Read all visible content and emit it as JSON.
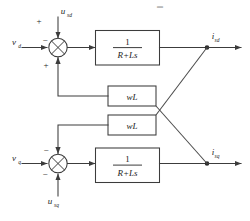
{
  "diagram": {
    "type": "block-diagram",
    "colors": {
      "line": "#3c3c3c",
      "text": "#1d1d1d",
      "background": "#ffffff"
    },
    "top_branch": {
      "input_label": "v",
      "input_sub": "d",
      "disturbance_label": "u",
      "disturbance_sub": "sd",
      "sign_top_left": "+",
      "sign_input": "−",
      "sign_bottom": "+",
      "plant_numerator": "1",
      "plant_denominator": "R+Ls",
      "output_label": "i",
      "output_sub": "sd"
    },
    "bottom_branch": {
      "input_label": "v",
      "input_sub": "q",
      "disturbance_label": "u",
      "disturbance_sub": "sq",
      "sign_top": "−",
      "sign_input": "−",
      "sign_bottom": "−",
      "plant_numerator": "1",
      "plant_denominator": "R+Ls",
      "output_label": "i",
      "output_sub": "sq"
    },
    "coupling_blocks": [
      {
        "label": "wL",
        "name": "upper-wl-block"
      },
      {
        "label": "wL",
        "name": "lower-wl-block"
      }
    ],
    "artifact": {
      "top_mark": "▬"
    }
  }
}
